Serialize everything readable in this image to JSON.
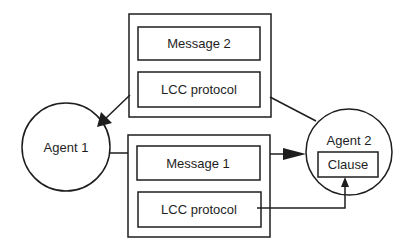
{
  "diagram": {
    "agents": [
      {
        "id": "agent1",
        "label": "Agent 1"
      },
      {
        "id": "agent2",
        "label": "Agent 2",
        "inner_box": "Clause"
      }
    ],
    "message_packets": [
      {
        "id": "packet-top",
        "message": "Message 2",
        "protocol": "LCC protocol",
        "direction": "Agent 2 -> Agent 1"
      },
      {
        "id": "packet-bottom",
        "message": "Message 1",
        "protocol": "LCC protocol",
        "direction": "Agent 1 -> Agent 2"
      }
    ],
    "edges": [
      {
        "from": "Agent 2",
        "to": "packet-top",
        "arrow": false
      },
      {
        "from": "packet-top",
        "to": "Agent 1",
        "arrow": true
      },
      {
        "from": "Agent 1",
        "to": "packet-bottom",
        "arrow": false
      },
      {
        "from": "packet-bottom",
        "to": "Agent 2",
        "arrow": true
      },
      {
        "from": "packet-bottom LCC protocol",
        "to": "Agent 2 Clause",
        "arrow": true
      }
    ],
    "colors": {
      "line": "#1e1e1e",
      "background": "#ffffff"
    }
  }
}
